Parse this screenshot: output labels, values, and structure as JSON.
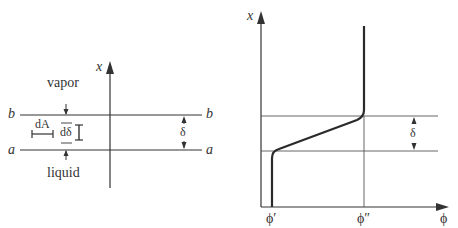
{
  "left_panel": {
    "axis_label": "x",
    "region_above": "vapor",
    "region_below": "liquid",
    "upper_interface_label_left": "b",
    "upper_interface_label_right": "b",
    "lower_interface_label_left": "a",
    "lower_interface_label_right": "a",
    "area_element_label": "dA",
    "thickness_element_label": "dδ",
    "interface_thickness_label": "δ"
  },
  "right_panel": {
    "y_axis_label": "x",
    "x_axis_label": "ϕ",
    "liquid_value_label": "ϕ′",
    "vapor_value_label": "ϕ″",
    "interface_thickness_label": "δ"
  },
  "colors": {
    "line": "#333333",
    "thin_line": "#555555",
    "background": "#ffffff"
  }
}
